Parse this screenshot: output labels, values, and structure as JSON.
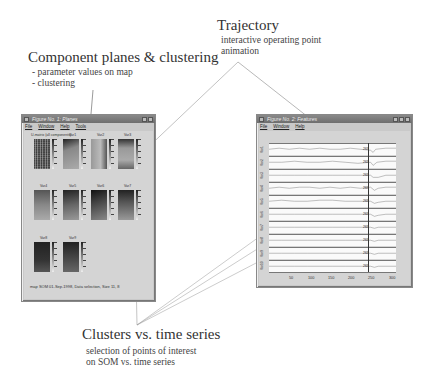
{
  "annotations": {
    "component_planes": {
      "title": "Component planes & clustering",
      "items": [
        "- parameter values on map",
        "- clustering"
      ]
    },
    "trajectory": {
      "title": "Trajectory",
      "items": [
        "interactive operating point",
        "animation"
      ]
    },
    "clusters": {
      "title": "Clusters vs. time series",
      "items": [
        "selection of points of interest",
        "on SOM vs. time series"
      ]
    }
  },
  "left_window": {
    "title": "Figure No. 1: Planes",
    "menu": [
      "File",
      "Window",
      "Help",
      "Tools"
    ],
    "first_plane_label": "U-matrix (all components)",
    "plane_labels": [
      "Var1",
      "Var2",
      "Var3",
      "Var4",
      "Var5",
      "Var6",
      "Var7",
      "Var8",
      "Var9"
    ],
    "status": "map SOM 01-Sep-1998, Data selection, Size 11, 8"
  },
  "right_window": {
    "title": "Figure No. 2: Features",
    "menu": [
      "File",
      "Window",
      "Help"
    ],
    "row_labels": [
      "Var1",
      "Var2",
      "Var3",
      "Var4",
      "Var5",
      "Var6",
      "Var7",
      "Var8",
      "Var9",
      "Var10"
    ],
    "point_label": "263",
    "x_ticks": [
      "50",
      "100",
      "150",
      "200",
      "250",
      "300"
    ]
  }
}
